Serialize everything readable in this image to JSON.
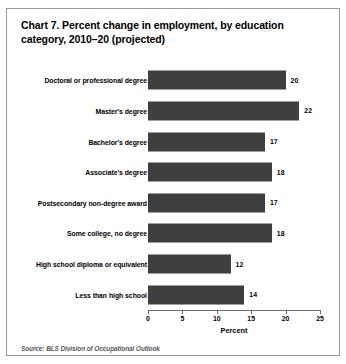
{
  "chart_data": {
    "type": "bar",
    "orientation": "horizontal",
    "title": "Chart 7. Percent change in employment, by education category, 2010–20 (projected)",
    "categories": [
      "Doctoral or professional degree",
      "Master's degree",
      "Bachelor's degree",
      "Associate's degree",
      "Postsecondary non-degree award",
      "Some college, no degree",
      "High school diploma or equivalent",
      "Less than high school"
    ],
    "values": [
      20,
      22,
      17,
      18,
      17,
      18,
      12,
      14
    ],
    "value_labels": [
      "20",
      "22",
      "17",
      "18",
      "17",
      "18",
      "12",
      "14"
    ],
    "xlabel": "Percent",
    "ylabel": "",
    "xlim": [
      0,
      25
    ],
    "xticks": [
      0,
      5,
      10,
      15,
      20,
      25
    ],
    "xtick_labels": [
      "0",
      "5",
      "10",
      "15",
      "20",
      "25"
    ],
    "grid": false,
    "legend": null,
    "bar_color": "#3f3f3f",
    "source": "Source: BLS Division of Occupational Outlook"
  }
}
